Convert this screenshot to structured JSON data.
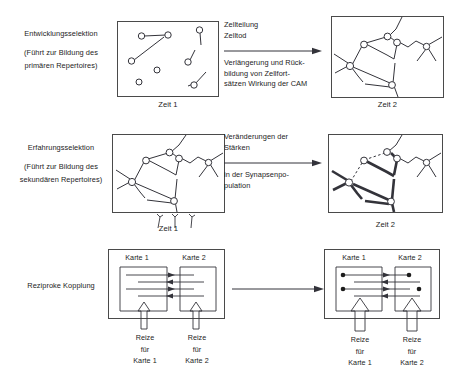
{
  "figure": {
    "language": "de",
    "rows": [
      {
        "id": "entwicklungsselektion",
        "left_label": {
          "title": "Entwicklungsselektion",
          "subtitle_line1": "(Führt zur Bildung des",
          "subtitle_line2": "primären Repertoires)"
        },
        "transition_text_top": "Zellteilung\nZelltod",
        "transition_text_bottom": "Verlängerung und Rück-\nbildung von Zellfort-\nsätzen Wirkung der CAM",
        "panel_left_caption": "Zeit 1",
        "panel_right_caption": "Zeit 2"
      },
      {
        "id": "erfahrungsselektion",
        "left_label": {
          "title": "Erfahrungsselektion",
          "subtitle_line1": "(Führt zur Bildung des",
          "subtitle_line2": "sekundären Repertoires)"
        },
        "transition_text_top": "Veränderungen der\nStärken",
        "transition_text_bottom": "in der Synapsenpo-\npulation",
        "panel_left_caption": "Zeit 1",
        "panel_right_caption": "Zeit 2"
      },
      {
        "id": "reziproke-kopplung",
        "left_label": {
          "title": "Reziproke Kopplung",
          "subtitle_line1": "",
          "subtitle_line2": ""
        },
        "transition_text_top": "",
        "transition_text_bottom": "",
        "panel_left_caption": "",
        "panel_right_caption": ""
      }
    ],
    "map_panels": {
      "karte_1": "Karte 1",
      "karte_2": "Karte 2",
      "reize_line1": "Reize",
      "reize_line2": "für",
      "reize_karte_1": "Karte 1",
      "reize_karte_2": "Karte 2"
    },
    "colors": {
      "ink": "#1c1c1c",
      "panel_border": "#4a4a4a",
      "line": "#33333a",
      "background": "#ffffff"
    }
  }
}
